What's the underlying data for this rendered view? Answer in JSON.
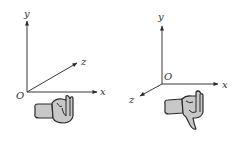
{
  "figure": {
    "panels": [
      {
        "name": "left-coordinate-system",
        "handedness": "left",
        "labels": {
          "y": "y",
          "z": "z",
          "x": "x",
          "origin": "O"
        },
        "origin": [
          27,
          92
        ],
        "axes": {
          "y": {
            "tip": [
              27,
              20
            ]
          },
          "x": {
            "tip": [
              98,
              92
            ]
          },
          "z": {
            "tip": [
              78,
              62
            ]
          }
        }
      },
      {
        "name": "right-coordinate-system",
        "handedness": "right",
        "labels": {
          "y": "y",
          "z": "z",
          "x": "x",
          "origin": "O"
        },
        "origin": [
          162,
          84
        ],
        "axes": {
          "y": {
            "tip": [
              162,
              25
            ]
          },
          "x": {
            "tip": [
              219,
              84
            ]
          },
          "z": {
            "tip": [
              139,
              97
            ]
          }
        }
      }
    ],
    "colors": {
      "axis": "#3a3a3a",
      "hand_fill": "#c8c8c8",
      "hand_stroke": "#2a2a2a",
      "text": "#333333"
    }
  }
}
